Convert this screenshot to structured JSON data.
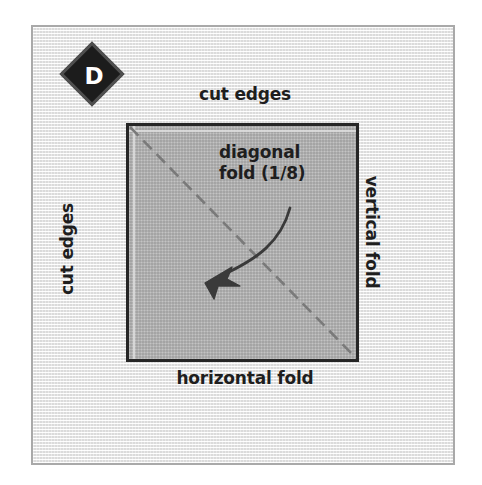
{
  "figure": {
    "panel_label": "D",
    "background_color": "#eeeeee",
    "frame_border_color": "#a9a9a9",
    "page_background": "#ffffff"
  },
  "badge": {
    "letter": "D",
    "shape": "diamond",
    "fill_color": "#1c1c1c",
    "ring_color": "#4f4f4f",
    "text_color": "#ffffff"
  },
  "paper": {
    "name": "folded-paper-square",
    "fill_color": "#b5b5b5",
    "border_color": "#262626"
  },
  "labels": {
    "cut_edges_top": "cut edges",
    "cut_edges_left": "cut edges",
    "vertical_fold": "vertical fold",
    "horizontal_fold": "horizontal fold",
    "diagonal_fold_line1": "diagonal",
    "diagonal_fold_line2": "fold (1/8)"
  },
  "annotations": {
    "diagonal_fold_line": {
      "style": "dashed",
      "color": "#7a7a7a",
      "dash_pattern": "12 7",
      "from": "top-left corner",
      "to": "bottom-right corner"
    },
    "pointer_arrow": {
      "color": "#3a3a3a",
      "style": "curved",
      "points_to": "diagonal fold line"
    }
  }
}
